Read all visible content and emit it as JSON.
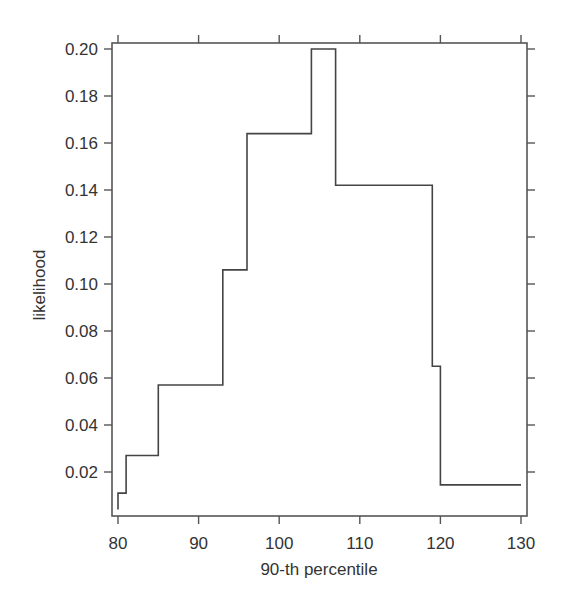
{
  "chart_data": {
    "type": "line",
    "subtype": "step",
    "title": "",
    "xlabel": "90-th percentile",
    "ylabel": "likelihood",
    "xlim": [
      80,
      130
    ],
    "ylim": [
      0.0,
      0.2
    ],
    "x_ticks": [
      80,
      90,
      100,
      110,
      120,
      130
    ],
    "x_tick_labels": [
      "80",
      "90",
      "100",
      "110",
      "120",
      "130"
    ],
    "y_ticks": [
      0.02,
      0.04,
      0.06,
      0.08,
      0.1,
      0.12,
      0.14,
      0.16,
      0.18,
      0.2
    ],
    "y_tick_labels": [
      "0.02",
      "0.04",
      "0.06",
      "0.08",
      "0.10",
      "0.12",
      "0.14",
      "0.16",
      "0.18",
      "0.20"
    ],
    "grid": false,
    "legend": null,
    "series": [
      {
        "name": "likelihood",
        "steps": [
          {
            "x_start": 80,
            "x_end": 80,
            "y": 0.004
          },
          {
            "x_start": 80,
            "x_end": 81,
            "y": 0.011
          },
          {
            "x_start": 81,
            "x_end": 85,
            "y": 0.027
          },
          {
            "x_start": 85,
            "x_end": 93,
            "y": 0.057
          },
          {
            "x_start": 93,
            "x_end": 96,
            "y": 0.106
          },
          {
            "x_start": 96,
            "x_end": 104,
            "y": 0.164
          },
          {
            "x_start": 104,
            "x_end": 107,
            "y": 0.2
          },
          {
            "x_start": 107,
            "x_end": 119,
            "y": 0.142
          },
          {
            "x_start": 119,
            "x_end": 120,
            "y": 0.065
          },
          {
            "x_start": 120,
            "x_end": 130,
            "y": 0.0145
          }
        ]
      }
    ]
  },
  "colors": {
    "line": "#444444",
    "frame": "#555555",
    "text": "#333333",
    "background": "#ffffff"
  }
}
